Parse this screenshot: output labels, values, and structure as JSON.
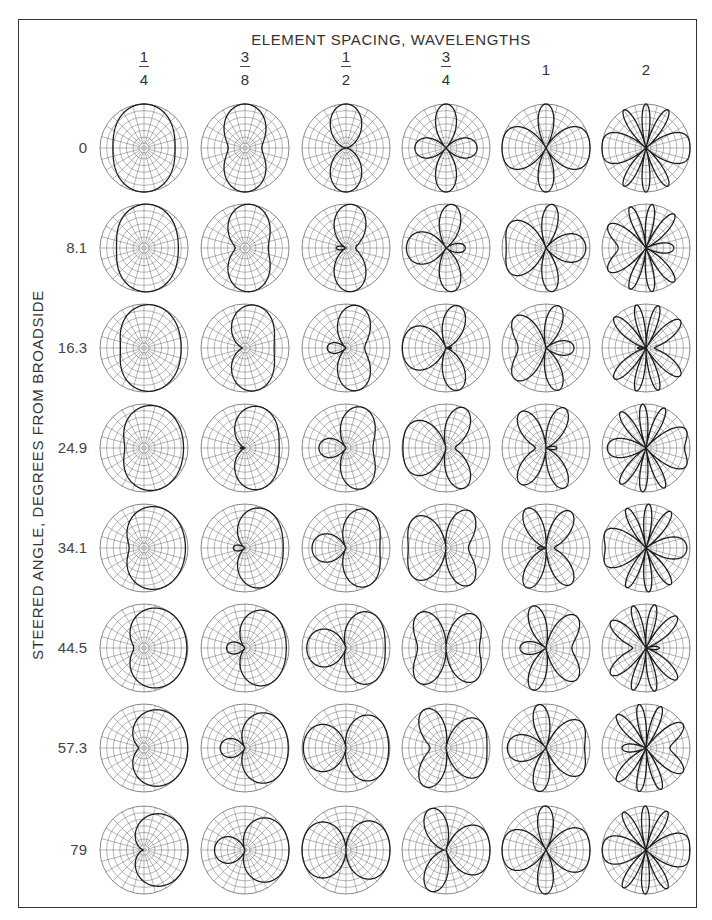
{
  "figure": {
    "title": "ELEMENT SPACING, WAVELENGTHS",
    "y_axis_label": "STEERED ANGLE, DEGREES FROM BROADSIDE"
  },
  "columns": [
    {
      "label_num": "1",
      "label_den": "4",
      "value": 0.25
    },
    {
      "label_num": "3",
      "label_den": "8",
      "value": 0.375
    },
    {
      "label_num": "1",
      "label_den": "2",
      "value": 0.5
    },
    {
      "label_num": "3",
      "label_den": "4",
      "value": 0.75
    },
    {
      "label_whole": "1",
      "value": 1
    },
    {
      "label_whole": "2",
      "value": 2
    }
  ],
  "rows": [
    {
      "label": "0",
      "value": 0
    },
    {
      "label": "8.1",
      "value": 8.1
    },
    {
      "label": "16.3",
      "value": 16.3
    },
    {
      "label": "24.9",
      "value": 24.9
    },
    {
      "label": "34.1",
      "value": 34.1
    },
    {
      "label": "44.5",
      "value": 44.5
    },
    {
      "label": "57.3",
      "value": 57.3
    },
    {
      "label": "79",
      "value": 79
    }
  ],
  "colors": {
    "pattern": "#1e1e1e",
    "grid": "#6a6a6a",
    "frame": "#333333"
  },
  "chart_data": {
    "type": "polar-grid",
    "title": "ELEMENT SPACING, WAVELENGTHS",
    "xlabel": "ELEMENT SPACING, WAVELENGTHS",
    "ylabel": "STEERED ANGLE, DEGREES FROM BROADSIDE",
    "x_categories": [
      "1/4",
      "3/8",
      "1/2",
      "3/4",
      "1",
      "2"
    ],
    "element_spacing_wavelengths": [
      0.25,
      0.375,
      0.5,
      0.75,
      1,
      2
    ],
    "y_categories": [
      "0",
      "8.1",
      "16.3",
      "24.9",
      "34.1",
      "44.5",
      "57.3",
      "79"
    ],
    "steered_angle_deg": [
      0,
      8.1,
      16.3,
      24.9,
      34.1,
      44.5,
      57.3,
      79
    ],
    "pattern_model": "two-element array factor |cos(pi*d*(cos(phi) - sin(theta0)))|, phi from array axis (horizontal), linear radial scale",
    "grid": {
      "radial_spokes_deg": 15,
      "rings": 8
    },
    "legend": null
  }
}
